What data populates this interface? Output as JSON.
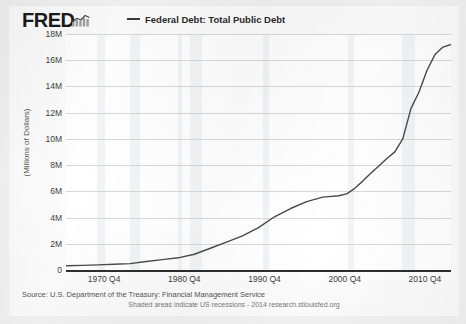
{
  "brand": {
    "logo_text": "FRED",
    "logo_icon": "mini-bar-chart-icon"
  },
  "legend": {
    "marker_icon": "line-dash-icon",
    "label": "Federal Debt: Total Public Debt",
    "color": "#3b3b3b"
  },
  "footer": {
    "source": "Source: U.S. Department of the Treasury: Financial Management Service",
    "note": "Shaded areas indicate US recessions - 2014 research.stlouisfed.org"
  },
  "colors": {
    "line": "#4a4a4a",
    "grid": "#d8d8d8",
    "axis": "#2d2d2d",
    "recession_band": "rgba(120,128,140,0.085)",
    "plot_background": "#ffffff",
    "page_background": "#f2f2f2"
  },
  "chart_data": {
    "type": "line",
    "title": "",
    "xlabel": "",
    "ylabel": "(Millions of Dollars)",
    "ylim": [
      0,
      18
    ],
    "xlim": [
      1966,
      2014
    ],
    "grid": true,
    "legend_position": "top",
    "y_ticks": [
      "0",
      "2M",
      "4M",
      "6M",
      "8M",
      "10M",
      "12M",
      "14M",
      "16M",
      "18M"
    ],
    "y_tick_values": [
      0,
      2,
      4,
      6,
      8,
      10,
      12,
      14,
      16,
      18
    ],
    "x_ticks": [
      "1970 Q4",
      "1980 Q4",
      "1990 Q4",
      "2000 Q4",
      "2010 Q4"
    ],
    "x_tick_values": [
      1970.75,
      1980.75,
      1990.75,
      2000.75,
      2010.75
    ],
    "series": [
      {
        "name": "Federal Debt: Total Public Debt",
        "units": "Millions of Dollars (shown in trillions scale labels)",
        "x": [
          1966,
          1968,
          1970,
          1972,
          1974,
          1976,
          1978,
          1980,
          1982,
          1984,
          1986,
          1988,
          1990,
          1992,
          1994,
          1996,
          1998,
          2000,
          2001,
          2002,
          2003,
          2004,
          2005,
          2006,
          2007,
          2008,
          2009,
          2010,
          2011,
          2012,
          2013,
          2014
        ],
        "values": [
          0.32,
          0.35,
          0.39,
          0.44,
          0.49,
          0.65,
          0.79,
          0.93,
          1.2,
          1.66,
          2.13,
          2.6,
          3.23,
          4.06,
          4.69,
          5.22,
          5.56,
          5.66,
          5.81,
          6.23,
          6.78,
          7.38,
          7.93,
          8.51,
          9.01,
          10.02,
          12.31,
          13.56,
          15.22,
          16.43,
          17.0,
          17.2
        ]
      }
    ],
    "recessions": [
      {
        "start": 1969.92,
        "end": 1970.92
      },
      {
        "start": 1973.92,
        "end": 1975.25
      },
      {
        "start": 1980.0,
        "end": 1980.5
      },
      {
        "start": 1981.5,
        "end": 1982.92
      },
      {
        "start": 1990.5,
        "end": 1991.25
      },
      {
        "start": 2001.17,
        "end": 2001.92
      },
      {
        "start": 2007.92,
        "end": 2009.5
      }
    ]
  }
}
